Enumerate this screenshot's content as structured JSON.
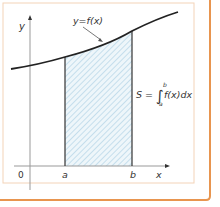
{
  "figure": {
    "labels": {
      "y_axis": "y",
      "x_axis": "x",
      "origin": "0",
      "a": "a",
      "b": "b",
      "curve": "y=f(x)",
      "formula_lhs": "S =",
      "formula_integral": "∫",
      "formula_upper": "b",
      "formula_lower": "a",
      "formula_body": "f(x)dx"
    },
    "colors": {
      "outer_border": "#e8954f",
      "inner_border": "#f3d3b8",
      "axis": "#999999",
      "curve": "#222222",
      "bound_lines": "#333333",
      "hatch": "#a9cfe3",
      "hatch_bg": "#eef6fa",
      "text": "#333333"
    }
  }
}
